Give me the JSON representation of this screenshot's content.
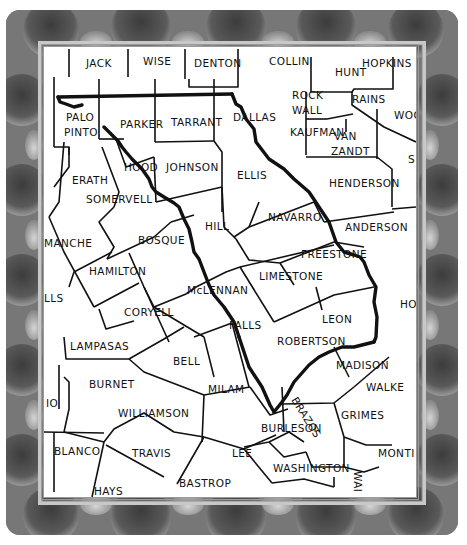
{
  "map": {
    "subject": "Central Texas counties map",
    "colors": {
      "border_dark": "#4a4a4a",
      "border_mid": "#7c7c7c",
      "border_light": "#bdbdbd",
      "map_bg": "#ffffff",
      "line": "#111111"
    },
    "counties": [
      {
        "id": "jack",
        "label": "JACK",
        "x": 42,
        "y": 20
      },
      {
        "id": "wise",
        "label": "WISE",
        "x": 99,
        "y": 18
      },
      {
        "id": "denton",
        "label": "DENTON",
        "x": 150,
        "y": 20
      },
      {
        "id": "collin",
        "label": "COLLIN",
        "x": 225,
        "y": 18
      },
      {
        "id": "hunt",
        "label": "HUNT",
        "x": 291,
        "y": 29
      },
      {
        "id": "hopkins",
        "label": "HOPKINS",
        "x": 318,
        "y": 20
      },
      {
        "id": "rockwall-1",
        "label": "ROCK",
        "x": 288,
        "y": 52
      },
      {
        "id": "rockwall-2",
        "label": "WALL",
        "x": 288,
        "y": 67
      },
      {
        "id": "rains",
        "label": "RAINS",
        "x": 308,
        "y": 52
      },
      {
        "id": "wood-partial",
        "label": "WOC",
        "x": 352,
        "y": 66
      },
      {
        "id": "palo-pinto-1",
        "label": "PALO",
        "x": 30,
        "y": 73
      },
      {
        "id": "palo-pinto-2",
        "label": "PINTO",
        "x": 28,
        "y": 88
      },
      {
        "id": "parker",
        "label": "PARKER",
        "x": 76,
        "y": 79
      },
      {
        "id": "tarrant",
        "label": "TARRANT",
        "x": 131,
        "y": 77
      },
      {
        "id": "dallas",
        "label": "DALLAS",
        "x": 190,
        "y": 72
      },
      {
        "id": "kaufman",
        "label": "KAUFMAN",
        "x": 287,
        "y": 89
      },
      {
        "id": "van-zandt-1",
        "label": "VAN",
        "x": 308,
        "y": 93
      },
      {
        "id": "van-zandt-2",
        "label": "ZANDT",
        "x": 305,
        "y": 108
      },
      {
        "id": "smith-partial",
        "label": "S",
        "x": 365,
        "y": 115
      },
      {
        "id": "erath",
        "label": "ERATH",
        "x": 31,
        "y": 135
      },
      {
        "id": "hood",
        "label": "HOOD",
        "x": 82,
        "y": 122
      },
      {
        "id": "johnson",
        "label": "JOHNSON",
        "x": 126,
        "y": 123
      },
      {
        "id": "ellis",
        "label": "ELLIS",
        "x": 194,
        "y": 131
      },
      {
        "id": "somervell",
        "label": "SOMERVELL",
        "x": 45,
        "y": 156
      },
      {
        "id": "henderson",
        "label": "HENDERSON",
        "x": 303,
        "y": 139
      },
      {
        "id": "navarro",
        "label": "NAVARRO",
        "x": 227,
        "y": 173
      },
      {
        "id": "hill",
        "label": "HILL",
        "x": 162,
        "y": 182
      },
      {
        "id": "anderson",
        "label": "ANDERSON",
        "x": 303,
        "y": 182
      },
      {
        "id": "comanche-partial",
        "label": "MANCHE",
        "x": 0,
        "y": 199
      },
      {
        "id": "bosque",
        "label": "BOSQUE",
        "x": 98,
        "y": 196
      },
      {
        "id": "freestone",
        "label": "FREESTONE",
        "x": 253,
        "y": 209
      },
      {
        "id": "hamilton",
        "label": "HAMILTON",
        "x": 46,
        "y": 227
      },
      {
        "id": "limestone",
        "label": "LIMESTONE",
        "x": 213,
        "y": 229
      },
      {
        "id": "mclennan",
        "label": "McLENNAN",
        "x": 128,
        "y": 247
      },
      {
        "id": "mills-partial",
        "label": "LLS",
        "x": 0,
        "y": 254
      },
      {
        "id": "houston-partial",
        "label": "HO",
        "x": 356,
        "y": 258
      },
      {
        "id": "coryell",
        "label": "CORYELL",
        "x": 78,
        "y": 268
      },
      {
        "id": "leon",
        "label": "LEON",
        "x": 277,
        "y": 273
      },
      {
        "id": "falls",
        "label": "FALLS",
        "x": 168,
        "y": 281
      },
      {
        "id": "lampasas",
        "label": "LAMPASAS",
        "x": 24,
        "y": 302
      },
      {
        "id": "robertson",
        "label": "ROBERTSON",
        "x": 236,
        "y": 296
      },
      {
        "id": "bell",
        "label": "BELL",
        "x": 130,
        "y": 317
      },
      {
        "id": "madison",
        "label": "MADISON",
        "x": 292,
        "y": 320
      },
      {
        "id": "burnet",
        "label": "BURNET",
        "x": 45,
        "y": 340
      },
      {
        "id": "walker-partial",
        "label": "WALKE",
        "x": 322,
        "y": 342
      },
      {
        "id": "milam",
        "label": "MILAM",
        "x": 166,
        "y": 345
      },
      {
        "id": "san-saba-partial",
        "label": "IO",
        "x": 0,
        "y": 360
      },
      {
        "id": "williamson",
        "label": "WILLIAMSON",
        "x": 72,
        "y": 370
      },
      {
        "id": "grimes",
        "label": "GRIMES",
        "x": 296,
        "y": 370
      },
      {
        "id": "burleson",
        "label": "BURLESON",
        "x": 217,
        "y": 385
      },
      {
        "id": "blanco",
        "label": "BLANCO",
        "x": 11,
        "y": 408
      },
      {
        "id": "travis",
        "label": "TRAVIS",
        "x": 86,
        "y": 410
      },
      {
        "id": "lee",
        "label": "LEE",
        "x": 191,
        "y": 410
      },
      {
        "id": "montgomery-partial",
        "label": "MONTI",
        "x": 334,
        "y": 410
      },
      {
        "id": "washington",
        "label": "WASHINGTON",
        "x": 229,
        "y": 424
      },
      {
        "id": "hays",
        "label": "HAYS",
        "x": 48,
        "y": 447
      },
      {
        "id": "bastrop",
        "label": "BASTROP",
        "x": 135,
        "y": 440
      },
      {
        "id": "gillespie-partial",
        "label": "G",
        "x": 5,
        "y": 20
      },
      {
        "id": "stephens-partial",
        "label": "S",
        "x": 0,
        "y": 73
      }
    ],
    "rotated_labels": [
      {
        "id": "brazos",
        "label": "BRAZOS",
        "x": 245,
        "y": 355,
        "rotate": 55
      },
      {
        "id": "waller-partial",
        "label": "WAI",
        "x": 307,
        "y": 424,
        "rotate": 90
      }
    ]
  }
}
